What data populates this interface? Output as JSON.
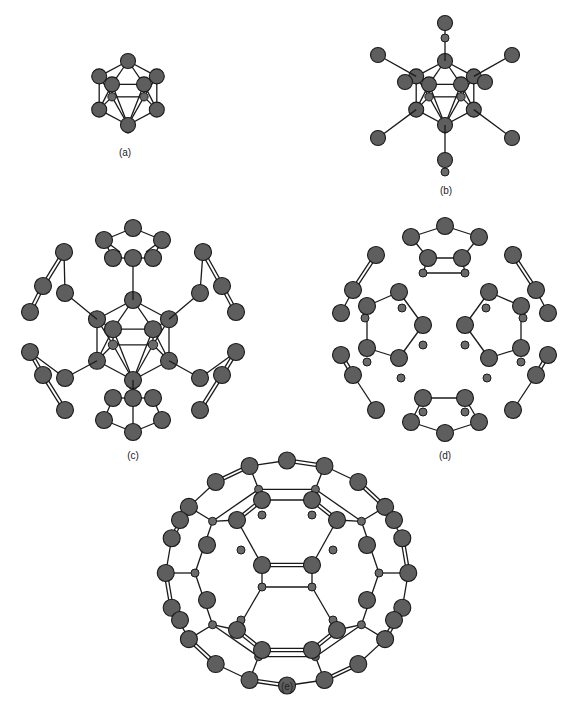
{
  "figure": {
    "panels": [
      {
        "id": "a",
        "label": "(a)",
        "label_pos": [
          125,
          154
        ]
      },
      {
        "id": "b",
        "label": "(b)",
        "label_pos": [
          445,
          192
        ]
      },
      {
        "id": "c",
        "label": "(c)",
        "label_pos": [
          133,
          457
        ]
      },
      {
        "id": "d",
        "label": "(d)",
        "label_pos": [
          445,
          457
        ]
      },
      {
        "id": "e",
        "label": "(e)",
        "label_pos": [
          287,
          688
        ]
      }
    ]
  }
}
